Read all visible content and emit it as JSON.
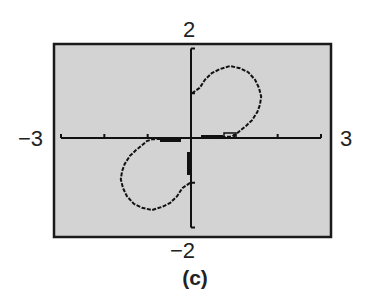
{
  "chart_data": {
    "type": "line",
    "title": "",
    "caption": "(c)",
    "xlabel": "",
    "ylabel": "",
    "xlim": [
      -3,
      3
    ],
    "ylim": [
      -2,
      2
    ],
    "x_tick_labels": {
      "min": "−3",
      "max": "3"
    },
    "y_tick_labels": {
      "min": "−2",
      "max": "2"
    },
    "x_ticks": [
      -3,
      -2,
      -1,
      0,
      1,
      2,
      3
    ],
    "y_ticks": [
      -2,
      -1,
      0,
      1,
      2
    ],
    "grid": false,
    "background": "#d3d3d3",
    "series": [
      {
        "name": "upper-loop",
        "x": [
          0.02,
          0.2,
          0.32,
          0.48,
          0.67,
          0.9,
          1.13,
          1.32,
          1.48,
          1.57,
          1.62,
          1.59,
          1.53,
          1.41,
          1.27,
          1.13,
          1.02,
          0.9,
          0.7,
          0.5,
          0.24
        ],
        "y": [
          1.0,
          1.12,
          1.3,
          1.45,
          1.54,
          1.61,
          1.56,
          1.47,
          1.3,
          1.12,
          0.92,
          0.74,
          0.58,
          0.4,
          0.27,
          0.16,
          0.07,
          0.03,
          0.02,
          0.02,
          0.02
        ]
      },
      {
        "name": "lower-loop",
        "x": [
          -0.02,
          -0.2,
          -0.32,
          -0.48,
          -0.67,
          -0.9,
          -1.13,
          -1.32,
          -1.48,
          -1.57,
          -1.62,
          -1.59,
          -1.53,
          -1.41,
          -1.27,
          -1.13,
          -1.02,
          -0.9,
          -0.7,
          -0.5,
          -0.24
        ],
        "y": [
          -1.0,
          -1.12,
          -1.3,
          -1.45,
          -1.54,
          -1.61,
          -1.56,
          -1.47,
          -1.3,
          -1.12,
          -0.92,
          -0.74,
          -0.58,
          -0.4,
          -0.27,
          -0.16,
          -0.07,
          -0.03,
          -0.02,
          -0.02,
          -0.02
        ]
      }
    ]
  },
  "labels": {
    "ymax": "2",
    "ymin": "−2",
    "xmin": "−3",
    "xmax": "3",
    "caption": "(c)"
  }
}
